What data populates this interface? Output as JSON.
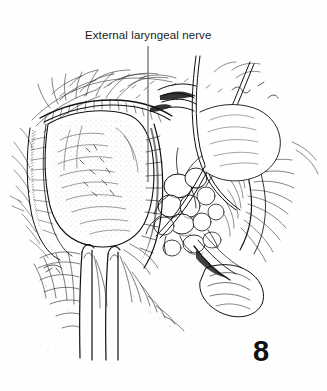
{
  "figure": {
    "type": "medical-illustration",
    "technique": "pen-and-ink line drawing",
    "number": "8",
    "background_color": "#fefefe",
    "ink_color": "#111111"
  },
  "annotations": {
    "label": {
      "text": "External laryngeal nerve",
      "x": 85,
      "y": 28,
      "leader_line": {
        "x": 148,
        "y_start": 46,
        "y_end": 182
      }
    }
  },
  "instruments": [
    {
      "name": "curved-retractor-upper",
      "description": "long curved retractor blade crossing the field from upper right"
    },
    {
      "name": "curved-hook-left",
      "description": "curved hook retractor arcing from top center"
    },
    {
      "name": "vertical-retractor-a",
      "description": "vertical retractor shaft descending at lower left"
    },
    {
      "name": "vertical-retractor-b",
      "description": "second vertical retractor shaft descending at lower center"
    }
  ],
  "structures": [
    {
      "name": "thyroid-lobe",
      "description": "large stippled thyroid lobe, left of center"
    },
    {
      "name": "strap-muscles",
      "description": "hatched muscle fibers framing the field"
    },
    {
      "name": "superior-thyroid-vessels",
      "description": "branching vessels in the central cluster"
    },
    {
      "name": "external-laryngeal-nerve",
      "description": "fine nerve indicated by the leader line"
    },
    {
      "name": "surrounding-fascia",
      "description": "radiating fascial strands at field margins"
    }
  ]
}
